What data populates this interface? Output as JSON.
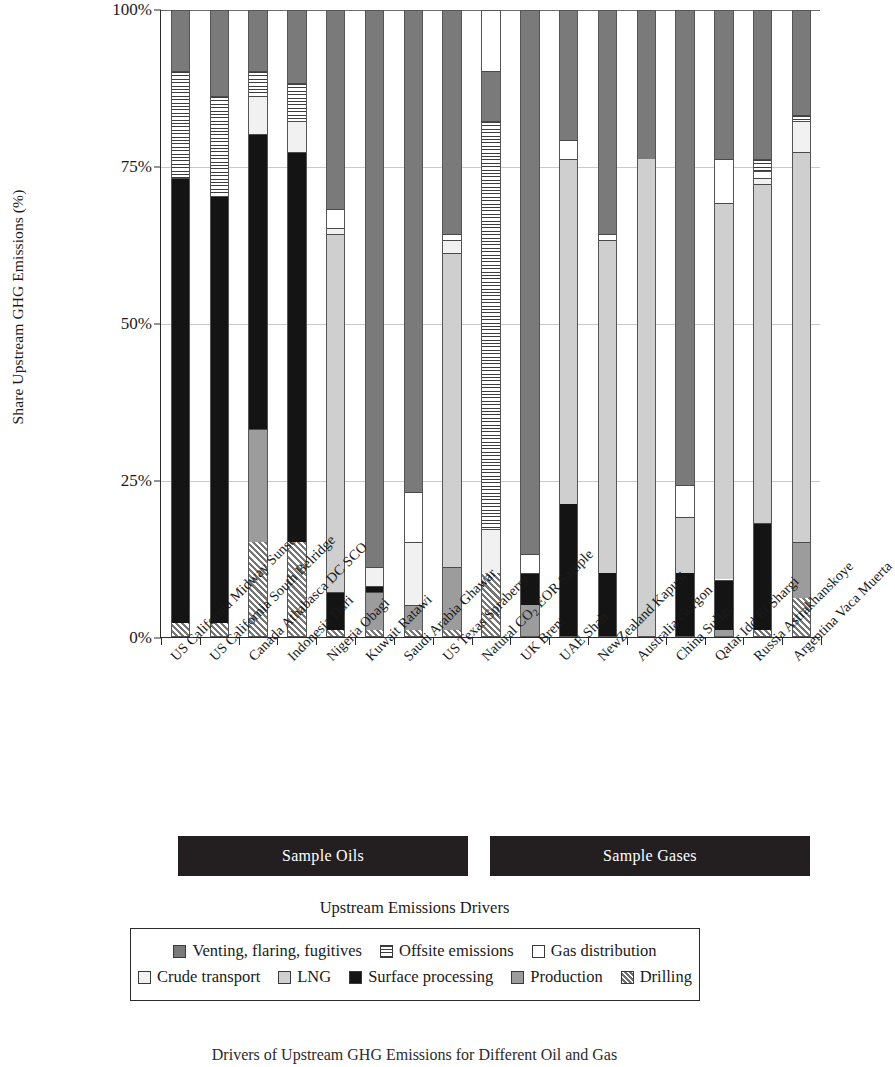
{
  "chart_data": {
    "type": "bar",
    "stacked": true,
    "normalized_percent": true,
    "title": "",
    "xlabel": "",
    "ylabel": "Share Upstream GHG Emissions (%)",
    "ylim": [
      0,
      100
    ],
    "ytick_labels": [
      "0%",
      "25%",
      "50%",
      "75%",
      "100%"
    ],
    "ytick_values": [
      0,
      25,
      50,
      75,
      100
    ],
    "grid": true,
    "legend_title": "Upstream Emissions Drivers",
    "legend_position": "bottom",
    "categories": [
      "US California Midway Sunset",
      "US California South Belridge",
      "Canada Athabasca DC SCO",
      "Indonesia Duri",
      "Nigeria Obagi",
      "Kuwait Ratawi",
      "Saudi Arabia Ghawar",
      "US Texas Spraberry",
      "Natural CO2 EOR Sample",
      "UK Brent",
      "UAE Shah",
      "NewZealand Kapuni",
      "Australia Gorgon",
      "China Suligc",
      "Qatar Idd El Shargi",
      "Russia Astrakhanskoye",
      "Argentina Vaca Muerta"
    ],
    "series": [
      {
        "name": "Drilling",
        "key": "drilling",
        "pattern": "diagonal-hatch",
        "color": "#767676",
        "values": [
          2,
          2,
          15,
          15,
          1,
          1,
          1,
          1,
          10,
          0,
          0,
          0,
          0,
          0,
          0,
          1,
          6
        ]
      },
      {
        "name": "Production",
        "key": "production",
        "pattern": "solid",
        "color": "#9c9c9c",
        "values": [
          0,
          0,
          18,
          0,
          0,
          6,
          4,
          10,
          0,
          5,
          0,
          0,
          0,
          0,
          1,
          0,
          9
        ]
      },
      {
        "name": "Surface processing",
        "key": "surface_processing",
        "pattern": "solid",
        "color": "#141414",
        "values": [
          71,
          68,
          47,
          62,
          6,
          1,
          0,
          0,
          0,
          5,
          21,
          10,
          0,
          10,
          8,
          17,
          0
        ]
      },
      {
        "name": "LNG",
        "key": "lng",
        "pattern": "solid",
        "color": "#cfcfcf",
        "values": [
          0,
          0,
          0,
          0,
          57,
          0,
          0,
          50,
          0,
          0,
          55,
          53,
          76,
          9,
          60,
          54,
          62
        ]
      },
      {
        "name": "Crude transport",
        "key": "crude_transport",
        "pattern": "stipple",
        "color": "#f1f1f1",
        "values": [
          0,
          0,
          6,
          5,
          1,
          3,
          10,
          2,
          7,
          0,
          0,
          0,
          0,
          0,
          0,
          1,
          5
        ]
      },
      {
        "name": "Gas distribution",
        "key": "gas_distribution",
        "pattern": "solid",
        "color": "#ffffff",
        "values": [
          0,
          0,
          0,
          0,
          3,
          0,
          8,
          1,
          0,
          3,
          3,
          1,
          0,
          5,
          7,
          1,
          0
        ]
      },
      {
        "name": "Offsite emissions",
        "key": "offsite_emissions",
        "pattern": "horizontal-lines",
        "color": "#3d3d3d",
        "values": [
          17,
          16,
          4,
          6,
          0,
          0,
          0,
          0,
          65,
          0,
          0,
          0,
          0,
          0,
          0,
          2,
          1
        ]
      },
      {
        "name": "Venting, flaring, fugitives",
        "key": "venting_flaring_fugitives",
        "pattern": "solid",
        "color": "#7a7a7a",
        "values": [
          10,
          14,
          10,
          12,
          32,
          89,
          77,
          36,
          8,
          87,
          21,
          36,
          24,
          76,
          24,
          24,
          17
        ]
      }
    ]
  },
  "axis": {
    "y_title": "Share Upstream GHG Emissions (%)",
    "y_ticks": [
      "100%",
      "75%",
      "50%",
      "25%",
      "0%"
    ]
  },
  "groups": [
    {
      "label": "Sample Oils"
    },
    {
      "label": "Sample Gases"
    }
  ],
  "legend": {
    "title": "Upstream Emissions Drivers",
    "row1": [
      {
        "label": "Venting, flaring, fugitives",
        "swatch": "f-venting"
      },
      {
        "label": "Offsite emissions",
        "swatch": "f-offsite"
      },
      {
        "label": "Gas distribution",
        "swatch": "f-gasdist"
      }
    ],
    "row2": [
      {
        "label": "Crude transport",
        "swatch": "f-crude"
      },
      {
        "label": "LNG",
        "swatch": "f-lng"
      },
      {
        "label": "Surface processing",
        "swatch": "f-surface"
      },
      {
        "label": "Production",
        "swatch": "f-production"
      },
      {
        "label": "Drilling",
        "swatch": "f-drilling"
      }
    ]
  },
  "caption": "Drivers of Upstream GHG Emissions for Different Oil and Gas"
}
